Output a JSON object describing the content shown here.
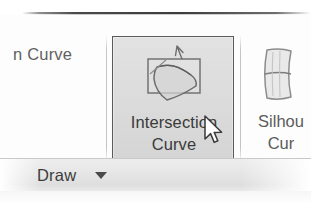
{
  "ribbon": {
    "left_partial_button": {
      "label": "n Curve",
      "note_truncated": true
    },
    "selected_button": {
      "label_line1": "Intersection",
      "label_line2": "Curve",
      "icon": "intersection-curve-icon",
      "state": "hovered",
      "border_color": "#5a5a5a",
      "fill_color": "#dcdcdc"
    },
    "right_partial_button": {
      "label_line1": "Silhou",
      "label_line2": "Cur",
      "icon": "silhouette-curve-icon",
      "note_truncated": true
    },
    "panel": {
      "title": "Draw",
      "dropdown_icon": "chevron-down-icon"
    }
  },
  "cursor": {
    "icon": "arrow-pointer-icon",
    "x": 203,
    "y": 115
  }
}
